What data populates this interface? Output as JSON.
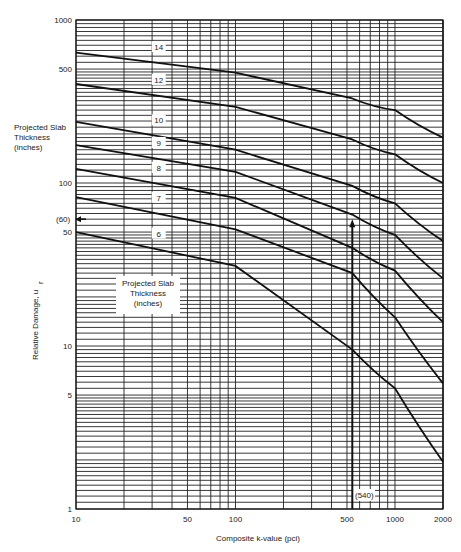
{
  "chart_data": {
    "type": "line",
    "title": "",
    "xlabel": "Composite k-value (pci)",
    "ylabel": "Relative Damage, u_r",
    "xscale": "log",
    "yscale": "log",
    "xlim": [
      10,
      2000
    ],
    "ylim": [
      1,
      1000
    ],
    "grid": true,
    "x_tick_labels": [
      "10",
      "50",
      "100",
      "500",
      "1000",
      "2000"
    ],
    "x_ticks": [
      10,
      50,
      100,
      500,
      1000,
      2000
    ],
    "y_tick_labels": [
      "1",
      "5",
      "10",
      "50",
      "100",
      "500",
      "1000"
    ],
    "y_ticks": [
      1,
      5,
      10,
      50,
      100,
      500,
      1000
    ],
    "legend_title": "Projected Slab Thickness (inches)",
    "legend_title_lines": [
      "Projected Slab",
      "Thickness",
      "(inches)"
    ],
    "x": [
      10,
      100,
      540,
      1000,
      2000
    ],
    "series": [
      {
        "name": "14",
        "values": [
          630,
          475,
          330,
          280,
          190
        ]
      },
      {
        "name": "12",
        "values": [
          405,
          293,
          185,
          150,
          100
        ]
      },
      {
        "name": "10",
        "values": [
          237,
          160,
          96,
          75,
          44
        ]
      },
      {
        "name": "9",
        "values": [
          171,
          117,
          64,
          48,
          26
        ]
      },
      {
        "name": "8",
        "values": [
          122,
          81,
          40,
          29,
          14
        ]
      },
      {
        "name": "7",
        "values": [
          82,
          52,
          60,
          15,
          5.9
        ]
      },
      {
        "name": "6",
        "values": [
          50,
          31,
          9.5,
          5.5,
          1.95
        ]
      }
    ],
    "annotations": [
      {
        "text": "(60)",
        "x": 10,
        "y": 60,
        "note": "arrow pointing to y-axis"
      },
      {
        "text": "(540)",
        "x": 540,
        "y": 1.5,
        "note": "vertical arrow from x-axis up to 7-inch curve"
      }
    ]
  },
  "labels": {
    "legend_top": [
      "Projected Slab",
      "Thickness",
      "(inches)"
    ],
    "legend_mid": [
      "Projected Slab",
      "Thickness",
      "(inches)"
    ],
    "ylabel": "Relative Damage, u",
    "ylabel_sub": "r",
    "xlabel": "Composite k-value (pci)",
    "ann_y": "(60)",
    "ann_x": "(540)"
  }
}
